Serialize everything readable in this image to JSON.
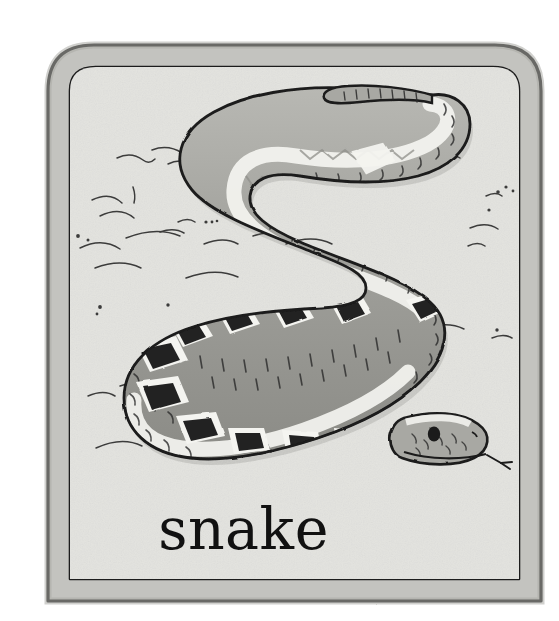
{
  "card": {
    "kind": "illustrated-flashcard",
    "caption": "snake",
    "subject": "snake",
    "media": "pen-and-ink with grey wash",
    "palette": {
      "page_background": "#ffffff",
      "frame_band": "#c3c3bf",
      "frame_band_shadow": "#b2b2ad",
      "inner_background": "#e3e3df",
      "ink": "#1b1b1b",
      "snake_body_light": "#b6b6b1",
      "snake_body_mid": "#9b9b96",
      "snake_body_dark": "#8a8a85",
      "snake_highlight": "#f2f2ee",
      "snake_blotch": "#222222",
      "caption_text": "#111111"
    },
    "frame": {
      "outer_left": 48,
      "outer_top": 45,
      "outer_right": 541,
      "outer_bottom": 601,
      "corner_radius_top": 46,
      "corner_radius_bottom": 0,
      "band_thickness": 22
    },
    "scene": {
      "description": "A grey-washed snake coiled in a wide S across a pale sandy ground.",
      "ground_marks": "scattered short curved ink strokes and dots suggesting sand",
      "snake": {
        "pose": "double S-curve, tail hooked at upper right, head resting at lower right",
        "tail_position": "top-right",
        "head_position": "bottom-right",
        "tongue": "forked, extended",
        "eye": "single dark round eye",
        "markings": "dark diamond blotches along the dorsal ridge, each ringed with a pale halo",
        "texture": "short crescent scale ticks over the whole body"
      }
    }
  }
}
